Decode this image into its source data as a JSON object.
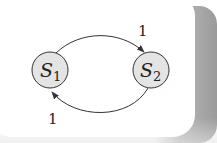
{
  "diagram": {
    "type": "state-transition",
    "nodes": [
      {
        "id": "S1",
        "label": "S",
        "subscript": "1",
        "cx": 50,
        "cy": 70,
        "r": 18,
        "fill": "#e4e4e4",
        "stroke": "#333333"
      },
      {
        "id": "S2",
        "label": "S",
        "subscript": "2",
        "cx": 151,
        "cy": 70,
        "r": 18,
        "fill": "#e4e4e4",
        "stroke": "#333333"
      }
    ],
    "edges": [
      {
        "from": "S1",
        "to": "S2",
        "label": "1",
        "position": "top"
      },
      {
        "from": "S2",
        "to": "S1",
        "label": "1",
        "position": "bottom"
      }
    ]
  },
  "colors": {
    "background": "#ffffff",
    "node_fill": "#e4e4e4",
    "stroke": "#333333",
    "shadow": "#9a9a9a"
  }
}
